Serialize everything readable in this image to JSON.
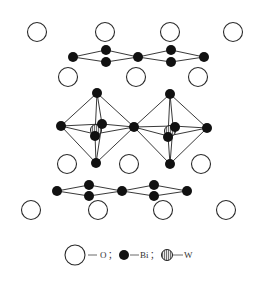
{
  "diagram": {
    "colors": {
      "oxygen_stroke": "#2a2a2a",
      "bismuth_fill": "#111111",
      "tungsten_hatch": "#888888",
      "background": "#ffffff"
    }
  },
  "legend": {
    "items": [
      {
        "symbol": "open-circle",
        "label": "O",
        "separator": "；"
      },
      {
        "symbol": "filled-circle",
        "label": "Bi",
        "separator": "；"
      },
      {
        "symbol": "hatched-circle",
        "label": "W",
        "separator": ""
      }
    ]
  },
  "atoms": {
    "oxygen_top_row": [
      [
        37,
        32
      ],
      [
        105,
        32
      ],
      [
        170,
        32
      ],
      [
        233,
        32
      ]
    ],
    "oxygen_second_row": [
      [
        68,
        77
      ],
      [
        136,
        77
      ],
      [
        198,
        77
      ]
    ],
    "oxygen_third_row": [
      [
        67,
        163
      ],
      [
        129,
        163
      ],
      [
        201,
        163
      ]
    ],
    "oxygen_bottom_row": [
      [
        31,
        209
      ],
      [
        98,
        209
      ],
      [
        163,
        209
      ],
      [
        226,
        209
      ]
    ],
    "bi_top_layer": [
      [
        73,
        57
      ],
      [
        106,
        50
      ],
      [
        106,
        62
      ],
      [
        138,
        57
      ],
      [
        171,
        50
      ],
      [
        171,
        62
      ],
      [
        204,
        57
      ]
    ],
    "bi_octahedra": [
      [
        97,
        93
      ],
      [
        61,
        126
      ],
      [
        102,
        124
      ],
      [
        95,
        134
      ],
      [
        134,
        127
      ],
      [
        96,
        163
      ],
      [
        170,
        94
      ],
      [
        207,
        128
      ],
      [
        173,
        126
      ],
      [
        168,
        136
      ],
      [
        170,
        164
      ]
    ],
    "bi_bottom_layer": [
      [
        57,
        191
      ],
      [
        89,
        185
      ],
      [
        89,
        196
      ],
      [
        122,
        191
      ],
      [
        154,
        185
      ],
      [
        154,
        196
      ],
      [
        187,
        191
      ]
    ],
    "w_centers": [
      [
        96,
        130
      ],
      [
        170,
        132
      ]
    ]
  }
}
